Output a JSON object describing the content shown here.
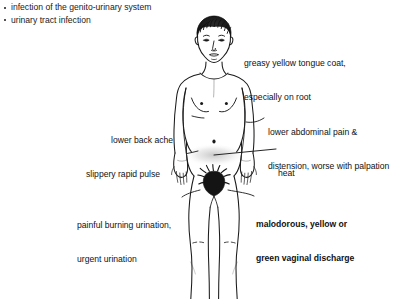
{
  "diagram": {
    "type": "anatomical-annotation-diagram",
    "background_color": "#ffffff",
    "line_color": "#1a1a1a"
  },
  "condition_list": {
    "items": [
      "infection of the genito-urinary system",
      "urinary tract infection"
    ]
  },
  "annotations": {
    "tongue": {
      "line1": "greasy yellow tongue coat,",
      "line2": "especially on root",
      "bold": false,
      "side": "right"
    },
    "abdominal": {
      "line1": "lower abdominal pain &",
      "line2": "distension, worse with palpation",
      "bold": false,
      "side": "right"
    },
    "heat": {
      "line1": "heat",
      "line2": "",
      "bold": false,
      "side": "right"
    },
    "discharge": {
      "line1": "malodorous, yellow or",
      "line2": "green vaginal discharge",
      "bold": true,
      "side": "right"
    },
    "backache": {
      "line1": "lower back ache",
      "line2": "",
      "bold": false,
      "side": "left"
    },
    "pulse": {
      "line1": "slippery rapid pulse",
      "line2": "",
      "bold": false,
      "side": "left"
    },
    "urination": {
      "line1": "painful burning urination,",
      "line2": "urgent urination",
      "bold": false,
      "side": "left"
    }
  }
}
